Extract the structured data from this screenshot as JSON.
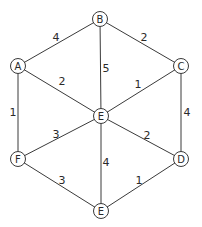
{
  "graph": {
    "nodes": [
      {
        "id": "B",
        "label": "B",
        "x": 100,
        "y": 19
      },
      {
        "id": "A",
        "label": "A",
        "x": 18,
        "y": 66
      },
      {
        "id": "C",
        "label": "C",
        "x": 181,
        "y": 66
      },
      {
        "id": "Ec",
        "label": "E",
        "x": 101,
        "y": 116
      },
      {
        "id": "F",
        "label": "F",
        "x": 18,
        "y": 159
      },
      {
        "id": "D",
        "label": "D",
        "x": 181,
        "y": 159
      },
      {
        "id": "Eb",
        "label": "E",
        "x": 101,
        "y": 211
      }
    ],
    "edges": [
      {
        "from": "A",
        "to": "B",
        "weight": "4",
        "lx": 56,
        "ly": 37
      },
      {
        "from": "B",
        "to": "C",
        "weight": "2",
        "lx": 144,
        "ly": 37
      },
      {
        "from": "B",
        "to": "Ec",
        "weight": "5",
        "lx": 106,
        "ly": 68
      },
      {
        "from": "A",
        "to": "Ec",
        "weight": "2",
        "lx": 62,
        "ly": 81
      },
      {
        "from": "C",
        "to": "Ec",
        "weight": "1",
        "lx": 138,
        "ly": 84
      },
      {
        "from": "A",
        "to": "F",
        "weight": "1",
        "lx": 13,
        "ly": 112
      },
      {
        "from": "C",
        "to": "D",
        "weight": "4",
        "lx": 187,
        "ly": 112
      },
      {
        "from": "F",
        "to": "Ec",
        "weight": "3",
        "lx": 56,
        "ly": 134
      },
      {
        "from": "Ec",
        "to": "D",
        "weight": "2",
        "lx": 147,
        "ly": 135
      },
      {
        "from": "Ec",
        "to": "Eb",
        "weight": "4",
        "lx": 106,
        "ly": 162
      },
      {
        "from": "F",
        "to": "Eb",
        "weight": "3",
        "lx": 62,
        "ly": 180
      },
      {
        "from": "D",
        "to": "Eb",
        "weight": "1",
        "lx": 139,
        "ly": 180
      }
    ]
  }
}
